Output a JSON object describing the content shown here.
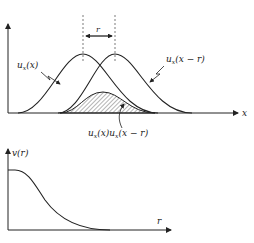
{
  "figure": {
    "top_panel": {
      "x_axis_label": "x",
      "shift_label": "r",
      "curve1_label": {
        "main": "u",
        "sub": "x",
        "arg": "(x)"
      },
      "curve2_label": {
        "main": "u",
        "sub": "x",
        "arg": "(x − r)"
      },
      "product_label": {
        "a_main": "u",
        "a_sub": "x",
        "a_arg": "(x)",
        "b_main": "u",
        "b_sub": "x",
        "b_arg": "(x − r)"
      }
    },
    "bottom_panel": {
      "y_axis_label": "v(r)",
      "x_axis_label": "r"
    },
    "colors": {
      "line": "#222222",
      "hatch": "#444444"
    }
  }
}
